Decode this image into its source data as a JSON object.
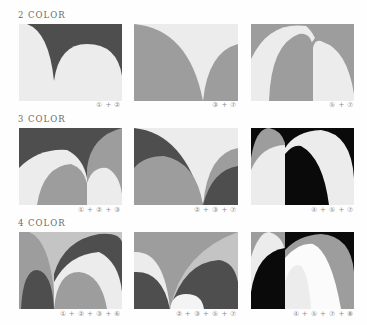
{
  "colors": {
    "dark": "#4e4e4e",
    "mid": "#9d9d9d",
    "light": "#ececec",
    "black": "#0a0a0a",
    "white": "#fbfbfb",
    "midlight": "#c4c4c4"
  },
  "sections": [
    {
      "title": "2 COLOR",
      "panels": [
        {
          "caption": "① + ②"
        },
        {
          "caption": "③ + ⑦"
        },
        {
          "caption": "⑤ + ⑦"
        }
      ]
    },
    {
      "title": "3 COLOR",
      "panels": [
        {
          "caption": "① + ② + ③"
        },
        {
          "caption": "② + ③ + ⑦"
        },
        {
          "caption": "④ + ⑤ + ⑦"
        }
      ]
    },
    {
      "title": "4 COLOR",
      "panels": [
        {
          "caption": "① + ② + ③ + ⑥"
        },
        {
          "caption": "② + ③ + ⑤ + ⑦"
        },
        {
          "caption": "④ + ⑤ + ⑦ + ⑧"
        }
      ]
    }
  ]
}
